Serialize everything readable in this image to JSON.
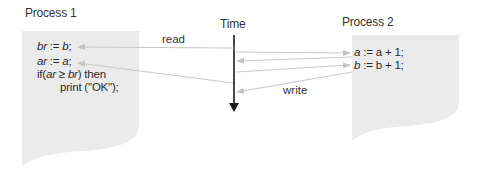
{
  "time_axis": {
    "label": "Time"
  },
  "process1": {
    "title": "Process 1",
    "lines": [
      {
        "var": "br",
        "op": " := ",
        "expr": "b",
        "end": ";"
      },
      {
        "var": "ar",
        "op": " := ",
        "expr": "a",
        "end": ";"
      },
      {
        "pre": "if(",
        "a": "ar",
        "mid": " ≥ ",
        "b": "br",
        "post": ") then"
      },
      {
        "text": "print (\"OK\");"
      }
    ]
  },
  "process2": {
    "title": "Process 2",
    "lines": [
      {
        "var": "a",
        "op": " := ",
        "expr": "a + 1;"
      },
      {
        "var": "b",
        "op": " := ",
        "expr": "b + 1;"
      }
    ]
  },
  "arrows": {
    "read_label": "read",
    "write_label": "write"
  },
  "colors": {
    "box_fill": "#ebebeb",
    "arrow": "#c8c8c8",
    "time_axis": "#1a1a1a",
    "text": "#2b2b2b"
  }
}
